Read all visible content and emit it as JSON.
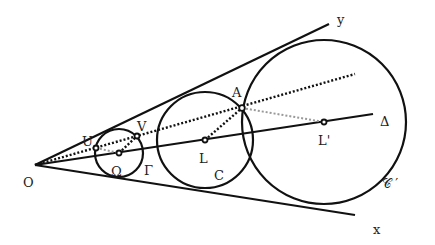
{
  "diagram": {
    "title": "",
    "colors": {
      "ink": "#111111",
      "gray_dots": "#999999",
      "background": "#ffffff"
    },
    "points": {
      "O": {
        "label": "O",
        "x": 35,
        "y": 165
      },
      "U": {
        "label": "U",
        "x": 96,
        "y": 148
      },
      "V": {
        "label": "V",
        "x": 137,
        "y": 136
      },
      "Omega": {
        "label": "Ω",
        "x": 119,
        "y": 153
      },
      "L": {
        "label": "L",
        "x": 205,
        "y": 140
      },
      "A": {
        "label": "A",
        "x": 242,
        "y": 108
      },
      "Lprime": {
        "label": "L'",
        "x": 324,
        "y": 122
      }
    },
    "circles": {
      "Gamma": {
        "label": "Γ",
        "cx": 119,
        "cy": 153,
        "r": 24
      },
      "C": {
        "label": "C",
        "cx": 205,
        "cy": 140,
        "r": 48
      },
      "Cprime": {
        "label": "𝒞 ′",
        "cx": 324,
        "cy": 122,
        "r": 82
      }
    },
    "lines": {
      "ray_y": {
        "label": "y"
      },
      "ray_x": {
        "label": "x"
      },
      "axis_delta": {
        "label": "Δ"
      }
    }
  }
}
